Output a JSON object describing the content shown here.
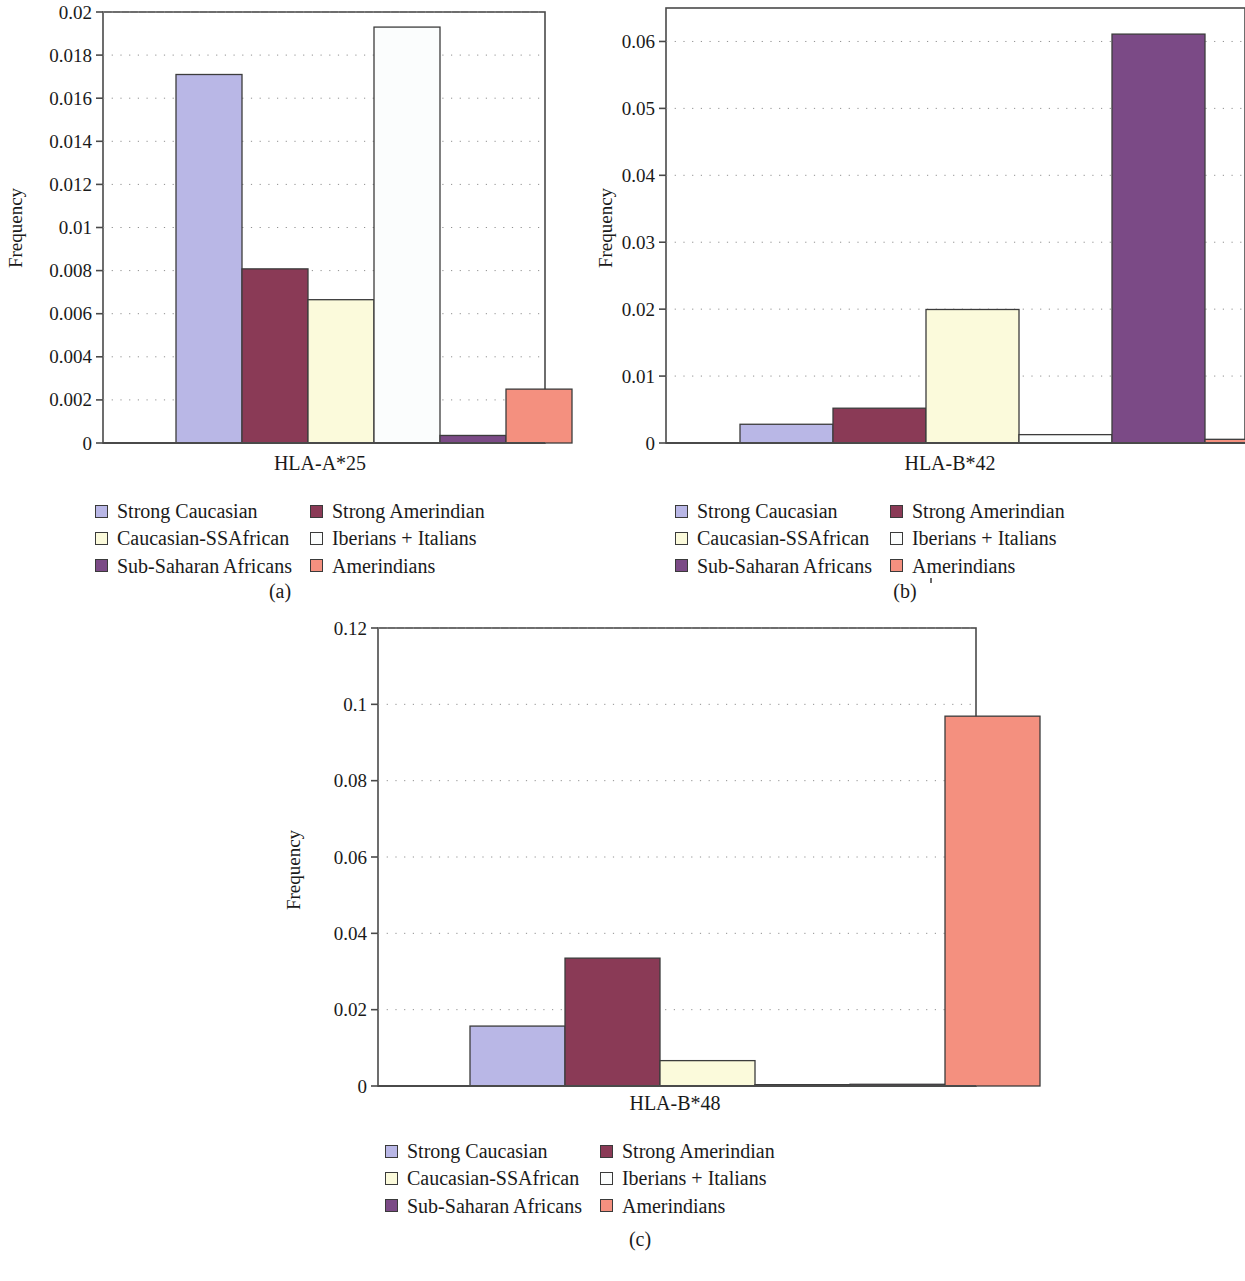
{
  "figure": {
    "panels": [
      {
        "id": "a",
        "caption": "(a)",
        "ylabel": "Frequency",
        "xcategory": "HLA-A*25",
        "ytick_labels": [
          "0",
          "0.002",
          "0.004",
          "0.006",
          "0.008",
          "0.01",
          "0.012",
          "0.014",
          "0.016",
          "0.018",
          "0.02"
        ]
      },
      {
        "id": "b",
        "caption": "(b)",
        "ylabel": "Frequency",
        "xcategory": "HLA-B*42",
        "ytick_labels": [
          "0",
          "0.01",
          "0.02",
          "0.03",
          "0.04",
          "0.05",
          "0.06"
        ]
      },
      {
        "id": "c",
        "caption": "(c)",
        "ylabel": "Frequency",
        "xcategory": "HLA-B*48",
        "ytick_labels": [
          "0",
          "0.02",
          "0.04",
          "0.06",
          "0.08",
          "0.1",
          "0.12"
        ]
      }
    ],
    "legend": {
      "items": [
        {
          "label": "Strong Caucasian",
          "color": "#b9b7e6"
        },
        {
          "label": "Strong Amerindian",
          "color": "#8a3a56"
        },
        {
          "label": "Caucasian-SSAfrican",
          "color": "#fbfadb"
        },
        {
          "label": "Iberians + Italians",
          "color": "#fbfdfd"
        },
        {
          "label": "Sub-Saharan Africans",
          "color": "#7b4a86"
        },
        {
          "label": "Amerindians",
          "color": "#f4907f"
        }
      ]
    }
  },
  "chart_data": [
    {
      "type": "bar",
      "title": "HLA-A*25",
      "panel": "a",
      "xlabel": "HLA-A*25",
      "ylabel": "Frequency",
      "ylim": [
        0,
        0.02
      ],
      "ytick_values": [
        0,
        0.002,
        0.004,
        0.006,
        0.008,
        0.01,
        0.012,
        0.014,
        0.016,
        0.018,
        0.02
      ],
      "grid": "horizontal-dotted",
      "legend_position": "below",
      "categories": [
        "Strong Caucasian",
        "Strong Amerindian",
        "Caucasian-SSAfrican",
        "Iberians + Italians",
        "Sub-Saharan Africans",
        "Amerindians"
      ],
      "values": [
        0.0171,
        0.00808,
        0.00665,
        0.0193,
        0.00035,
        0.0025
      ],
      "colors": [
        "#b9b7e6",
        "#8a3a56",
        "#fbfadb",
        "#fbfdfd",
        "#7b4a86",
        "#f4907f"
      ]
    },
    {
      "type": "bar",
      "title": "HLA-B*42",
      "panel": "b",
      "xlabel": "HLA-B*42",
      "ylabel": "Frequency",
      "ylim": [
        0,
        0.065
      ],
      "ytick_values": [
        0,
        0.01,
        0.02,
        0.03,
        0.04,
        0.05,
        0.06
      ],
      "grid": "horizontal-dotted",
      "legend_position": "below",
      "categories": [
        "Strong Caucasian",
        "Strong Amerindian",
        "Caucasian-SSAfrican",
        "Iberians + Italians",
        "Sub-Saharan Africans",
        "Amerindians"
      ],
      "values": [
        0.0028,
        0.0052,
        0.01995,
        0.00125,
        0.0611,
        0.00055
      ],
      "colors": [
        "#b9b7e6",
        "#8a3a56",
        "#fbfadb",
        "#fbfdfd",
        "#7b4a86",
        "#f4907f"
      ]
    },
    {
      "type": "bar",
      "title": "HLA-B*48",
      "panel": "c",
      "xlabel": "HLA-B*48",
      "ylabel": "Frequency",
      "ylim": [
        0,
        0.12
      ],
      "ytick_values": [
        0,
        0.02,
        0.04,
        0.06,
        0.08,
        0.1,
        0.12
      ],
      "grid": "horizontal-dotted",
      "legend_position": "below",
      "categories": [
        "Strong Caucasian",
        "Strong Amerindian",
        "Caucasian-SSAfrican",
        "Iberians + Italians",
        "Sub-Saharan Africans",
        "Amerindians"
      ],
      "values": [
        0.0157,
        0.0335,
        0.00665,
        0.00035,
        0.00045,
        0.0969
      ],
      "colors": [
        "#b9b7e6",
        "#8a3a56",
        "#fbfadb",
        "#fbfdfd",
        "#7b4a86",
        "#f4907f"
      ]
    }
  ]
}
